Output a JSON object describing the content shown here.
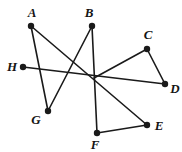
{
  "figure": {
    "background_color": "#ffffff",
    "stroke_color": "#1a1a1a",
    "label_color": "#141414",
    "stroke_width": 1.6,
    "vertex_radius": 3.2,
    "width": 182,
    "height": 152,
    "points": [
      {
        "id": "A",
        "label": "A",
        "x": 31,
        "y": 26,
        "label_x": 32,
        "label_y": 12
      },
      {
        "id": "B",
        "label": "B",
        "x": 92,
        "y": 26,
        "label_x": 89,
        "label_y": 12
      },
      {
        "id": "C",
        "label": "C",
        "x": 147,
        "y": 49,
        "label_x": 148,
        "label_y": 34
      },
      {
        "id": "D",
        "label": "D",
        "x": 165,
        "y": 84,
        "label_x": 175,
        "label_y": 88
      },
      {
        "id": "E",
        "label": "E",
        "x": 147,
        "y": 125,
        "label_x": 159,
        "label_y": 125
      },
      {
        "id": "F",
        "label": "F",
        "x": 97,
        "y": 133,
        "label_x": 95,
        "label_y": 144
      },
      {
        "id": "G",
        "label": "G",
        "x": 48,
        "y": 111,
        "label_x": 36,
        "label_y": 119
      },
      {
        "id": "H",
        "label": "H",
        "x": 23,
        "y": 67,
        "label_x": 12,
        "label_y": 66
      },
      {
        "id": "O",
        "label": "",
        "x": 94,
        "y": 78,
        "label_x": 94,
        "label_y": 78
      }
    ],
    "segments": [
      {
        "id": "seg-A-G",
        "from": "A",
        "to": "G"
      },
      {
        "id": "seg-A-E",
        "from": "A",
        "to": "E"
      },
      {
        "id": "seg-B-F",
        "from": "B",
        "to": "F"
      },
      {
        "id": "seg-B-G",
        "from": "B",
        "to": "G"
      },
      {
        "id": "seg-H-D",
        "from": "H",
        "to": "D"
      },
      {
        "id": "seg-C-O",
        "from": "C",
        "to": "O"
      },
      {
        "id": "seg-C-D",
        "from": "C",
        "to": "D"
      },
      {
        "id": "seg-F-E",
        "from": "F",
        "to": "E"
      }
    ]
  }
}
